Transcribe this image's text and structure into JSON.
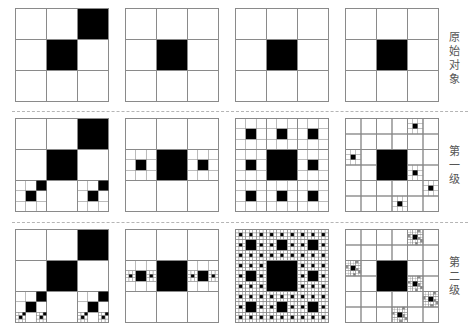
{
  "figure": {
    "stroke_color": "#8a8a8a",
    "fill_color": "#000000",
    "separator_color": "#b5b5b5",
    "rows": [
      {
        "label": "原始对象",
        "level": 0,
        "top": 8
      },
      {
        "label": "第一级",
        "level": 1,
        "top": 118
      },
      {
        "label": "第二级",
        "level": 2,
        "top": 229
      }
    ],
    "columns": [
      {
        "left": 15,
        "grid": 3,
        "filled": [
          [
            0,
            2
          ],
          [
            1,
            1
          ]
        ],
        "recurse": [
          [
            2,
            0
          ],
          [
            2,
            2
          ]
        ]
      },
      {
        "left": 125,
        "grid": 3,
        "filled": [
          [
            1,
            1
          ]
        ],
        "recurse": [
          [
            1,
            0
          ],
          [
            1,
            2
          ]
        ]
      },
      {
        "left": 235,
        "grid": 3,
        "filled": [
          [
            1,
            1
          ]
        ],
        "recurse": [
          [
            0,
            0
          ],
          [
            0,
            1
          ],
          [
            0,
            2
          ],
          [
            1,
            0
          ],
          [
            1,
            2
          ],
          [
            2,
            0
          ],
          [
            2,
            1
          ],
          [
            2,
            2
          ]
        ]
      },
      {
        "left": 345,
        "grid": 3,
        "filled": [
          [
            1,
            1
          ]
        ],
        "subgrid": 6,
        "recurse6": [
          [
            0,
            4
          ],
          [
            2,
            0
          ],
          [
            3,
            4
          ],
          [
            4,
            5
          ],
          [
            5,
            3
          ]
        ]
      }
    ],
    "separators_y": [
      111,
      222
    ]
  }
}
